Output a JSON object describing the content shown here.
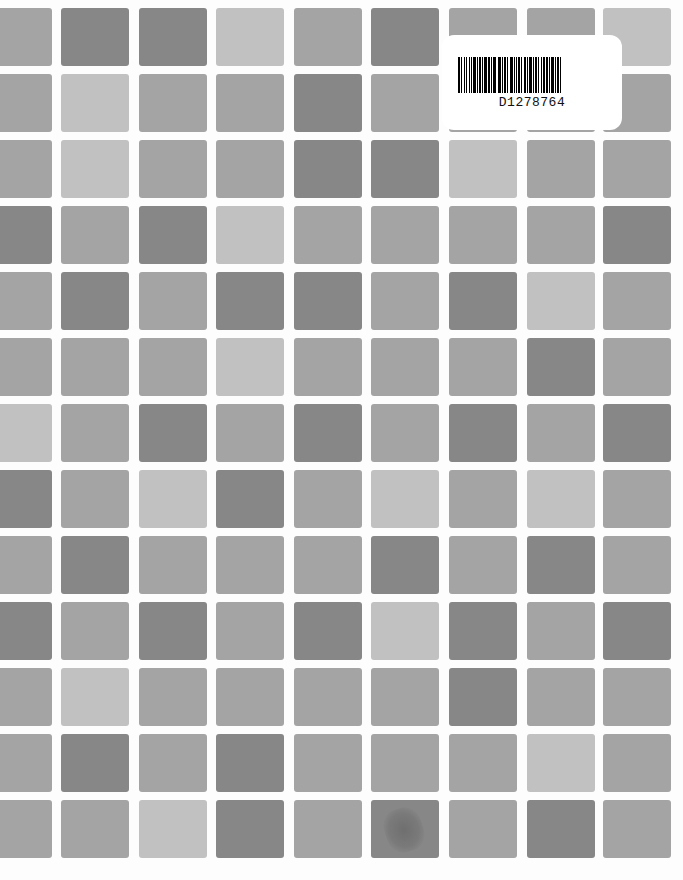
{
  "page": {
    "type": "scanned book cover",
    "background": "#fdfdfd"
  },
  "palette": {
    "L": "#c1c1c1",
    "M": "#a4a4a4",
    "D": "#878787"
  },
  "grid": {
    "columns_x": [
      -16,
      61,
      139,
      216,
      294,
      371,
      449,
      527,
      603
    ],
    "rows_y": [
      8,
      74,
      140,
      206,
      272,
      338,
      404,
      470,
      536,
      602,
      668,
      734,
      800
    ],
    "tile_width": 68,
    "tile_height": 58,
    "rows": [
      [
        "M",
        "D",
        "D",
        "L",
        "M",
        "D",
        "M",
        "M",
        "L"
      ],
      [
        "M",
        "L",
        "M",
        "M",
        "D",
        "M",
        "M",
        "M",
        "M"
      ],
      [
        "M",
        "L",
        "M",
        "M",
        "D",
        "D",
        "L",
        "M",
        "M"
      ],
      [
        "D",
        "M",
        "D",
        "L",
        "M",
        "M",
        "M",
        "M",
        "D"
      ],
      [
        "M",
        "D",
        "M",
        "D",
        "D",
        "M",
        "D",
        "L",
        "M"
      ],
      [
        "M",
        "M",
        "M",
        "L",
        "M",
        "M",
        "M",
        "D",
        "M"
      ],
      [
        "L",
        "M",
        "D",
        "M",
        "D",
        "M",
        "D",
        "M",
        "D"
      ],
      [
        "D",
        "M",
        "L",
        "D",
        "M",
        "L",
        "M",
        "L",
        "M"
      ],
      [
        "M",
        "D",
        "M",
        "M",
        "M",
        "D",
        "M",
        "D",
        "M"
      ],
      [
        "D",
        "M",
        "D",
        "M",
        "D",
        "L",
        "D",
        "M",
        "D"
      ],
      [
        "M",
        "L",
        "M",
        "M",
        "M",
        "M",
        "D",
        "M",
        "M"
      ],
      [
        "M",
        "D",
        "M",
        "D",
        "M",
        "M",
        "M",
        "L",
        "M"
      ],
      [
        "M",
        "M",
        "L",
        "D",
        "M",
        "D",
        "M",
        "D",
        "M"
      ]
    ],
    "smudge_tile": {
      "row": 12,
      "col": 5
    }
  },
  "barcode_label": {
    "code": "D1278764",
    "bars": [
      2,
      1,
      1,
      2,
      1,
      1,
      2,
      2,
      1,
      1,
      1,
      1,
      3,
      1,
      1,
      1,
      2,
      1,
      1,
      2,
      3,
      1,
      2,
      1,
      1,
      1,
      3,
      2,
      1,
      1,
      2,
      1,
      1,
      1,
      2,
      1,
      1,
      2,
      3,
      1,
      1,
      2,
      1,
      1,
      2,
      1,
      1,
      2,
      2,
      1,
      1,
      1,
      3,
      2,
      1,
      1,
      2,
      1,
      1,
      2,
      1,
      1,
      2,
      1,
      2,
      2,
      1,
      1,
      3,
      1,
      1,
      1,
      2,
      1,
      1,
      2
    ]
  }
}
